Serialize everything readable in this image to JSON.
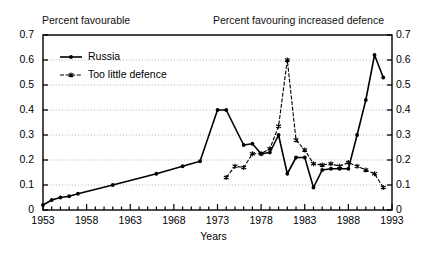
{
  "chart_data": {
    "type": "line",
    "title": "",
    "title_left": "Percent favourable",
    "title_right": "Percent favouring increased defence",
    "xlabel": "Years",
    "ylabel": "",
    "xlim": [
      1953,
      1993
    ],
    "ylim": [
      0,
      0.7
    ],
    "grid": true,
    "legend_position": "top-left",
    "y_ticks": [
      "0",
      "0.1",
      "0.2",
      "0.3",
      "0.4",
      "0.5",
      "0.6",
      "0.7"
    ],
    "y_tick_values": [
      0,
      0.1,
      0.2,
      0.3,
      0.4,
      0.5,
      0.6,
      0.7
    ],
    "x_ticks": [
      "1953",
      "1958",
      "1963",
      "1968",
      "1973",
      "1978",
      "1983",
      "1988",
      "1993"
    ],
    "x_tick_values": [
      1953,
      1958,
      1963,
      1968,
      1973,
      1978,
      1983,
      1988,
      1993
    ],
    "x_minor_step": 1,
    "series": [
      {
        "name": "Russia",
        "style": "solid",
        "marker": "dot",
        "color": "#000000",
        "x": [
          1953,
          1954,
          1955,
          1956,
          1957,
          1961,
          1966,
          1969,
          1971,
          1973,
          1974,
          1976,
          1977,
          1978,
          1979,
          1980,
          1981,
          1982,
          1983,
          1984,
          1985,
          1986,
          1987,
          1988,
          1989,
          1990,
          1991,
          1992
        ],
        "values": [
          0.02,
          0.04,
          0.05,
          0.055,
          0.065,
          0.1,
          0.145,
          0.175,
          0.195,
          0.4,
          0.4,
          0.26,
          0.265,
          0.225,
          0.23,
          0.3,
          0.145,
          0.21,
          0.21,
          0.09,
          0.16,
          0.165,
          0.165,
          0.165,
          0.3,
          0.44,
          0.62,
          0.53
        ]
      },
      {
        "name": "Too little defence",
        "style": "dashed",
        "marker": "star",
        "color": "#000000",
        "x": [
          1974,
          1975,
          1976,
          1977,
          1978,
          1979,
          1980,
          1981,
          1982,
          1983,
          1984,
          1985,
          1986,
          1987,
          1988,
          1989,
          1990,
          1991,
          1992
        ],
        "values": [
          0.13,
          0.175,
          0.17,
          0.225,
          0.225,
          0.245,
          0.335,
          0.6,
          0.28,
          0.24,
          0.185,
          0.18,
          0.185,
          0.175,
          0.19,
          0.175,
          0.16,
          0.145,
          0.09
        ]
      }
    ]
  },
  "legend": {
    "items": [
      {
        "label": "Russia"
      },
      {
        "label": "Too little defence"
      }
    ]
  }
}
